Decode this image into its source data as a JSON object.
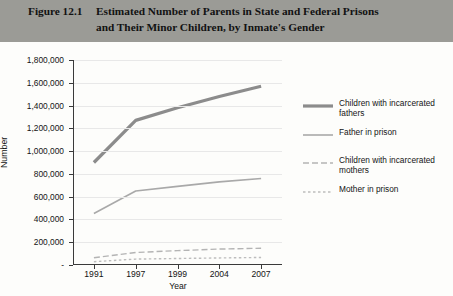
{
  "figure": {
    "label": "Figure 12.1",
    "title": "Estimated Number of Parents in State and Federal Prisons and Their Minor Children, by Inmate's Gender",
    "banner_color": "#9b9b96"
  },
  "chart_data": {
    "type": "line",
    "title": "Estimated Number of Parents in State and Federal Prisons and Their Minor Children, by Inmate's Gender",
    "xlabel": "Year",
    "ylabel": "Number",
    "categories": [
      "1991",
      "1997",
      "1999",
      "2004",
      "2007"
    ],
    "ylim": [
      0,
      1800000
    ],
    "ytick_step": 200000,
    "ytick_labels": [
      "-",
      "200,000",
      "400,000",
      "600,000",
      "800,000",
      "1,000,000",
      "1,200,000",
      "1,400,000",
      "1,600,000",
      "1,800,000"
    ],
    "ytick_values": [
      0,
      200000,
      400000,
      600000,
      800000,
      1000000,
      1200000,
      1400000,
      1600000,
      1800000
    ],
    "grid": true,
    "legend_position": "right",
    "series": [
      {
        "name": "Children with incarcerated fathers",
        "style": "solid-thick",
        "color": "#8c8c8c",
        "width": 3.2,
        "values": [
          900000,
          1270000,
          1380000,
          1480000,
          1570000
        ]
      },
      {
        "name": "Father in prison",
        "style": "solid-thin",
        "color": "#a9a9a9",
        "width": 1.6,
        "values": [
          452000,
          650000,
          690000,
          730000,
          760000
        ]
      },
      {
        "name": "Children with incarcerated mothers",
        "style": "dashed-long",
        "color": "#b4b4b4",
        "width": 1.4,
        "values": [
          64000,
          110000,
          126000,
          140000,
          147000
        ]
      },
      {
        "name": "Mother in prison",
        "style": "dashed-short",
        "color": "#bdbdbd",
        "width": 1.4,
        "values": [
          29000,
          52000,
          57000,
          62000,
          66000
        ]
      }
    ]
  },
  "legend": {
    "entries": [
      {
        "label": "Children with incarcerated fathers"
      },
      {
        "label": "Father in prison"
      },
      {
        "label": "Children with incarcerated mothers"
      },
      {
        "label": "Mother in prison"
      }
    ]
  }
}
